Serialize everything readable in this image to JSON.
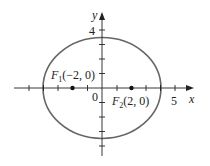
{
  "diagram": {
    "type": "ellipse",
    "equation_params": {
      "a": 4,
      "b": 3.46,
      "c": 2
    },
    "colors": {
      "ellipse": "#666666",
      "axes": "#222222",
      "foci": "#111111"
    },
    "axes": {
      "x_label": "x",
      "y_label": "y",
      "origin_label": "0",
      "x_tick_label": "5",
      "y_tick_label": "4"
    },
    "foci": [
      {
        "name": "F",
        "sub": "1",
        "coords": "(−2, 0)"
      },
      {
        "name": "F",
        "sub": "2",
        "coords": "(2, 0)"
      }
    ]
  }
}
